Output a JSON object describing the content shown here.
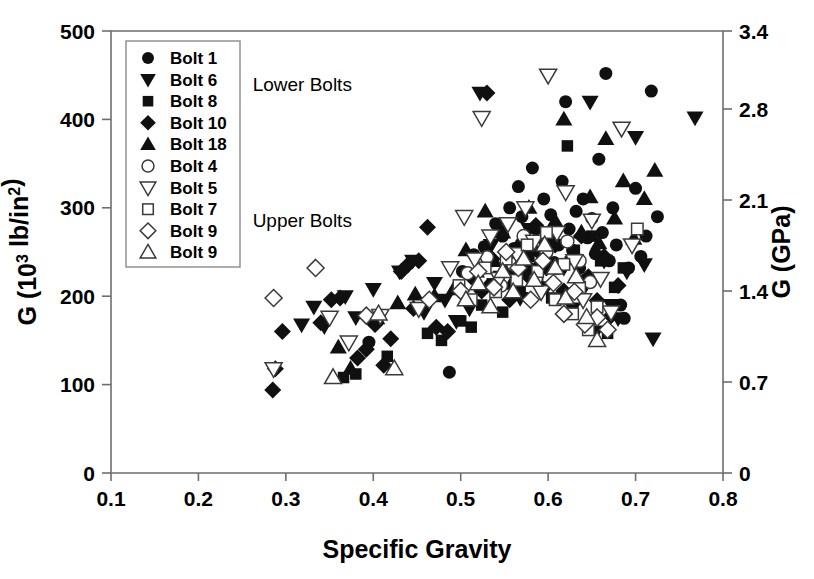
{
  "chart_data": {
    "type": "scatter",
    "title": "",
    "xlabel": "Specific Gravity",
    "ylabel": "G (10³ lb/in²)",
    "ylabel_right": "G (GPa)",
    "xlim": [
      0.1,
      0.8
    ],
    "ylim": [
      0,
      500
    ],
    "ylim_right": [
      0,
      3.4
    ],
    "xticks": [
      "0.1",
      "0.2",
      "0.3",
      "0.4",
      "0.5",
      "0.6",
      "0.7",
      "0.8"
    ],
    "xtick_values": [
      0.1,
      0.2,
      0.3,
      0.4,
      0.5,
      0.6,
      0.7,
      0.8
    ],
    "yticks": [
      "0",
      "100",
      "200",
      "300",
      "400",
      "500"
    ],
    "ytick_values": [
      0,
      100,
      200,
      300,
      400,
      500
    ],
    "yticks_right": [
      "0",
      "0.7",
      "1.4",
      "2.1",
      "2.8",
      "3.4"
    ],
    "ytick_right_values": [
      0,
      0.7,
      1.4,
      2.1,
      2.8,
      3.4
    ],
    "grid": false,
    "legend_position": "upper-left-inside",
    "annotations": [
      {
        "text": "Lower Bolts",
        "x": 0.262,
        "y": 432
      },
      {
        "text": "Upper Bolts",
        "x": 0.262,
        "y": 278
      }
    ],
    "series": [
      {
        "name": "Bolt 1",
        "marker": "circle",
        "fill": "filled",
        "points": [
          [
            0.395,
            148
          ],
          [
            0.487,
            114
          ],
          [
            0.502,
            228
          ],
          [
            0.515,
            247
          ],
          [
            0.527,
            256
          ],
          [
            0.533,
            212
          ],
          [
            0.54,
            282
          ],
          [
            0.548,
            268
          ],
          [
            0.552,
            238
          ],
          [
            0.556,
            300
          ],
          [
            0.561,
            254
          ],
          [
            0.566,
            324
          ],
          [
            0.57,
            290
          ],
          [
            0.574,
            262
          ],
          [
            0.578,
            232
          ],
          [
            0.582,
            345
          ],
          [
            0.586,
            276
          ],
          [
            0.59,
            250
          ],
          [
            0.595,
            310
          ],
          [
            0.599,
            268
          ],
          [
            0.603,
            292
          ],
          [
            0.607,
            238
          ],
          [
            0.612,
            258
          ],
          [
            0.616,
            330
          ],
          [
            0.62,
            420
          ],
          [
            0.624,
            276
          ],
          [
            0.628,
            252
          ],
          [
            0.632,
            296
          ],
          [
            0.636,
            232
          ],
          [
            0.64,
            310
          ],
          [
            0.645,
            266
          ],
          [
            0.65,
            288
          ],
          [
            0.654,
            248
          ],
          [
            0.658,
            355
          ],
          [
            0.662,
            272
          ],
          [
            0.666,
            452
          ],
          [
            0.67,
            240
          ],
          [
            0.674,
            300
          ],
          [
            0.678,
            258
          ],
          [
            0.683,
            190
          ],
          [
            0.687,
            175
          ],
          [
            0.692,
            232
          ],
          [
            0.7,
            322
          ],
          [
            0.706,
            245
          ],
          [
            0.712,
            268
          ],
          [
            0.718,
            432
          ],
          [
            0.725,
            290
          ]
        ]
      },
      {
        "name": "Bolt 6",
        "marker": "triangle-down",
        "fill": "filled",
        "points": [
          [
            0.318,
            168
          ],
          [
            0.332,
            188
          ],
          [
            0.344,
            166
          ],
          [
            0.368,
            200
          ],
          [
            0.38,
            176
          ],
          [
            0.4,
            208
          ],
          [
            0.43,
            228
          ],
          [
            0.445,
            240
          ],
          [
            0.458,
            182
          ],
          [
            0.47,
            215
          ],
          [
            0.482,
            196
          ],
          [
            0.495,
            172
          ],
          [
            0.51,
            186
          ],
          [
            0.522,
            430
          ],
          [
            0.535,
            258
          ],
          [
            0.546,
            222
          ],
          [
            0.558,
            240
          ],
          [
            0.568,
            198
          ],
          [
            0.578,
            276
          ],
          [
            0.588,
            250
          ],
          [
            0.598,
            210
          ],
          [
            0.608,
            268
          ],
          [
            0.618,
            232
          ],
          [
            0.628,
            186
          ],
          [
            0.638,
            204
          ],
          [
            0.648,
            420
          ],
          [
            0.655,
            160
          ],
          [
            0.664,
            240
          ],
          [
            0.672,
            190
          ],
          [
            0.68,
            175
          ],
          [
            0.69,
            228
          ],
          [
            0.7,
            380
          ],
          [
            0.71,
            236
          ],
          [
            0.72,
            152
          ],
          [
            0.768,
            402
          ]
        ]
      },
      {
        "name": "Bolt 8",
        "marker": "square",
        "fill": "filled",
        "points": [
          [
            0.366,
            108
          ],
          [
            0.38,
            112
          ],
          [
            0.416,
            132
          ],
          [
            0.462,
            158
          ],
          [
            0.478,
            150
          ],
          [
            0.5,
            172
          ],
          [
            0.512,
            165
          ],
          [
            0.524,
            190
          ],
          [
            0.536,
            214
          ],
          [
            0.548,
            182
          ],
          [
            0.558,
            228
          ],
          [
            0.568,
            205
          ],
          [
            0.578,
            245
          ],
          [
            0.588,
            222
          ],
          [
            0.596,
            258
          ],
          [
            0.604,
            198
          ],
          [
            0.613,
            236
          ],
          [
            0.622,
            370
          ],
          [
            0.63,
            252
          ],
          [
            0.64,
            218
          ],
          [
            0.65,
            268
          ],
          [
            0.66,
            240
          ],
          [
            0.668,
            158
          ],
          [
            0.676,
            210
          ],
          [
            0.686,
            232
          ]
        ]
      },
      {
        "name": "Bolt 10",
        "marker": "diamond",
        "fill": "filled",
        "points": [
          [
            0.285,
            94
          ],
          [
            0.288,
            118
          ],
          [
            0.296,
            160
          ],
          [
            0.34,
            170
          ],
          [
            0.352,
            196
          ],
          [
            0.362,
            198
          ],
          [
            0.382,
            130
          ],
          [
            0.392,
            140
          ],
          [
            0.402,
            168
          ],
          [
            0.412,
            122
          ],
          [
            0.42,
            152
          ],
          [
            0.432,
            228
          ],
          [
            0.44,
            236
          ],
          [
            0.446,
            186
          ],
          [
            0.452,
            240
          ],
          [
            0.462,
            278
          ],
          [
            0.472,
            165
          ],
          [
            0.485,
            160
          ],
          [
            0.512,
            222
          ],
          [
            0.524,
            206
          ],
          [
            0.53,
            430
          ],
          [
            0.536,
            242
          ],
          [
            0.546,
            270
          ],
          [
            0.556,
            196
          ],
          [
            0.566,
            250
          ],
          [
            0.576,
            224
          ],
          [
            0.586,
            280
          ],
          [
            0.598,
            232
          ],
          [
            0.608,
            258
          ],
          [
            0.618,
            206
          ],
          [
            0.628,
            244
          ],
          [
            0.638,
            268
          ],
          [
            0.646,
            222
          ],
          [
            0.656,
            195
          ],
          [
            0.664,
            245
          ],
          [
            0.672,
            178
          ],
          [
            0.68,
            212
          ]
        ]
      },
      {
        "name": "Bolt 18",
        "marker": "triangle-up",
        "fill": "filled",
        "points": [
          [
            0.36,
            142
          ],
          [
            0.374,
            118
          ],
          [
            0.404,
            175
          ],
          [
            0.428,
            192
          ],
          [
            0.448,
            202
          ],
          [
            0.47,
            200
          ],
          [
            0.492,
            208
          ],
          [
            0.506,
            252
          ],
          [
            0.518,
            228
          ],
          [
            0.528,
            296
          ],
          [
            0.538,
            240
          ],
          [
            0.548,
            272
          ],
          [
            0.558,
            214
          ],
          [
            0.568,
            262
          ],
          [
            0.578,
            300
          ],
          [
            0.588,
            236
          ],
          [
            0.598,
            258
          ],
          [
            0.608,
            285
          ],
          [
            0.618,
            400
          ],
          [
            0.628,
            248
          ],
          [
            0.638,
            272
          ],
          [
            0.648,
            312
          ],
          [
            0.658,
            260
          ],
          [
            0.666,
            378
          ],
          [
            0.676,
            288
          ],
          [
            0.686,
            330
          ],
          [
            0.698,
            265
          ],
          [
            0.71,
            310
          ],
          [
            0.722,
            342
          ]
        ]
      },
      {
        "name": "Bolt 4",
        "marker": "circle",
        "fill": "open",
        "points": [
          [
            0.508,
            226
          ],
          [
            0.53,
            244
          ],
          [
            0.546,
            212
          ],
          [
            0.56,
            236
          ],
          [
            0.572,
            268
          ],
          [
            0.586,
            220
          ],
          [
            0.598,
            250
          ],
          [
            0.61,
            232
          ],
          [
            0.622,
            262
          ],
          [
            0.636,
            240
          ],
          [
            0.648,
            216
          ]
        ]
      },
      {
        "name": "Bolt 5",
        "marker": "triangle-down",
        "fill": "open",
        "points": [
          [
            0.286,
            118
          ],
          [
            0.35,
            176
          ],
          [
            0.372,
            148
          ],
          [
            0.408,
            178
          ],
          [
            0.452,
            186
          ],
          [
            0.488,
            232
          ],
          [
            0.504,
            290
          ],
          [
            0.516,
            242
          ],
          [
            0.524,
            402
          ],
          [
            0.534,
            268
          ],
          [
            0.544,
            220
          ],
          [
            0.554,
            282
          ],
          [
            0.564,
            248
          ],
          [
            0.574,
            300
          ],
          [
            0.584,
            262
          ],
          [
            0.592,
            205
          ],
          [
            0.6,
            450
          ],
          [
            0.61,
            272
          ],
          [
            0.62,
            318
          ],
          [
            0.63,
            240
          ],
          [
            0.64,
            196
          ],
          [
            0.65,
            286
          ],
          [
            0.66,
            220
          ],
          [
            0.672,
            182
          ],
          [
            0.684,
            390
          ],
          [
            0.696,
            258
          ]
        ]
      },
      {
        "name": "Bolt 7",
        "marker": "square",
        "fill": "open",
        "points": [
          [
            0.498,
            212
          ],
          [
            0.512,
            196
          ],
          [
            0.528,
            232
          ],
          [
            0.54,
            205
          ],
          [
            0.552,
            242
          ],
          [
            0.564,
            218
          ],
          [
            0.576,
            258
          ],
          [
            0.588,
            228
          ],
          [
            0.598,
            272
          ],
          [
            0.608,
            196
          ],
          [
            0.618,
            236
          ],
          [
            0.628,
            180
          ],
          [
            0.636,
            210
          ],
          [
            0.646,
            162
          ],
          [
            0.656,
            188
          ],
          [
            0.702,
            276
          ]
        ]
      },
      {
        "name": "Bolt 9",
        "marker": "diamond",
        "fill": "open",
        "points": [
          [
            0.286,
            198
          ],
          [
            0.334,
            232
          ],
          [
            0.392,
            178
          ],
          [
            0.464,
            196
          ],
          [
            0.5,
            206
          ],
          [
            0.52,
            228
          ],
          [
            0.538,
            210
          ],
          [
            0.552,
            250
          ],
          [
            0.566,
            232
          ],
          [
            0.58,
            196
          ],
          [
            0.594,
            240
          ],
          [
            0.606,
            215
          ],
          [
            0.618,
            180
          ],
          [
            0.63,
            205
          ],
          [
            0.642,
            168
          ],
          [
            0.656,
            176
          ],
          [
            0.668,
            162
          ]
        ]
      },
      {
        "name": "Bolt 9 ",
        "marker": "triangle-up",
        "fill": "open",
        "points": [
          [
            0.354,
            108
          ],
          [
            0.406,
            180
          ],
          [
            0.424,
            118
          ],
          [
            0.506,
            196
          ],
          [
            0.52,
            214
          ],
          [
            0.534,
            188
          ],
          [
            0.548,
            228
          ],
          [
            0.56,
            205
          ],
          [
            0.572,
            242
          ],
          [
            0.584,
            218
          ],
          [
            0.596,
            258
          ],
          [
            0.608,
            232
          ],
          [
            0.62,
            198
          ],
          [
            0.632,
            222
          ],
          [
            0.644,
            176
          ],
          [
            0.656,
            150
          ]
        ]
      }
    ]
  },
  "legend": {
    "entries": [
      {
        "label": "Bolt 1",
        "marker": "circle",
        "fill": "filled"
      },
      {
        "label": "Bolt 6",
        "marker": "triangle-down",
        "fill": "filled"
      },
      {
        "label": "Bolt 8",
        "marker": "square",
        "fill": "filled"
      },
      {
        "label": "Bolt 10",
        "marker": "diamond",
        "fill": "filled"
      },
      {
        "label": "Bolt 18",
        "marker": "triangle-up",
        "fill": "filled"
      },
      {
        "label": "Bolt 4",
        "marker": "circle",
        "fill": "open"
      },
      {
        "label": "Bolt 5",
        "marker": "triangle-down",
        "fill": "open"
      },
      {
        "label": "Bolt 7",
        "marker": "square",
        "fill": "open"
      },
      {
        "label": "Bolt 9",
        "marker": "diamond",
        "fill": "open"
      },
      {
        "label": "Bolt 9",
        "marker": "triangle-up",
        "fill": "open"
      }
    ]
  },
  "colors": {
    "marker_fill": "#101010",
    "marker_stroke": "#3a3a3a",
    "axis": "#6e6e6e",
    "text": "#000000",
    "background": "#ffffff"
  }
}
